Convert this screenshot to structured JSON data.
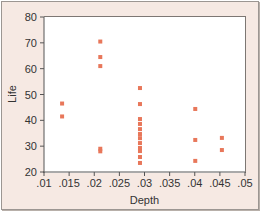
{
  "chart_data": {
    "type": "scatter",
    "title": "",
    "xlabel": "Depth",
    "ylabel": "Life",
    "xlim": [
      0.01,
      0.05
    ],
    "ylim": [
      20,
      80
    ],
    "grid": false,
    "legend": null,
    "x_ticks": [
      ".01",
      ".015",
      ".02",
      ".025",
      ".03",
      ".035",
      ".04",
      ".045",
      ".05"
    ],
    "y_ticks": [
      "20",
      "30",
      "40",
      "50",
      "60",
      "70",
      "80"
    ],
    "marker_color": "#e8775a",
    "frame_color": "#f6e9e3",
    "series": [
      {
        "name": "Life vs Depth",
        "points": [
          {
            "x": 0.0136,
            "y": 46.5
          },
          {
            "x": 0.0136,
            "y": 41.5
          },
          {
            "x": 0.0212,
            "y": 70.5
          },
          {
            "x": 0.0212,
            "y": 64.5
          },
          {
            "x": 0.0212,
            "y": 61.0
          },
          {
            "x": 0.0212,
            "y": 29.0
          },
          {
            "x": 0.0212,
            "y": 28.0
          },
          {
            "x": 0.0291,
            "y": 52.5
          },
          {
            "x": 0.0291,
            "y": 46.3
          },
          {
            "x": 0.0291,
            "y": 40.5
          },
          {
            "x": 0.0291,
            "y": 38.6
          },
          {
            "x": 0.0291,
            "y": 36.6
          },
          {
            "x": 0.0291,
            "y": 34.7
          },
          {
            "x": 0.0291,
            "y": 33.1
          },
          {
            "x": 0.0291,
            "y": 31.2
          },
          {
            "x": 0.0291,
            "y": 29.3
          },
          {
            "x": 0.0291,
            "y": 28.1
          },
          {
            "x": 0.0291,
            "y": 25.8
          },
          {
            "x": 0.0291,
            "y": 23.5
          },
          {
            "x": 0.0401,
            "y": 44.4
          },
          {
            "x": 0.0401,
            "y": 32.4
          },
          {
            "x": 0.0401,
            "y": 24.3
          },
          {
            "x": 0.0454,
            "y": 33.2
          },
          {
            "x": 0.0454,
            "y": 28.5
          }
        ]
      }
    ]
  }
}
